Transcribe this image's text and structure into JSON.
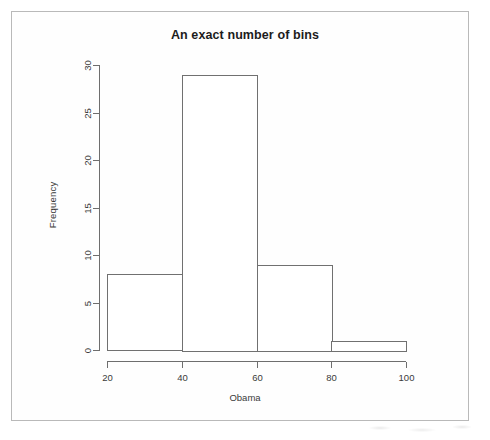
{
  "chart_data": {
    "type": "bar",
    "title": "An exact number of bins",
    "xlabel": "Obama",
    "ylabel": "Frequency",
    "categories": [
      "20-40",
      "40-60",
      "60-80",
      "80-100"
    ],
    "bin_edges": [
      20,
      40,
      60,
      80,
      100
    ],
    "values": [
      8,
      29,
      9,
      1
    ],
    "xlim": [
      20,
      100
    ],
    "ylim": [
      0,
      30
    ],
    "x_ticks": [
      20,
      40,
      60,
      80,
      100
    ],
    "y_ticks": [
      0,
      5,
      10,
      15,
      20,
      25,
      30
    ],
    "x_tick_labels": [
      "20",
      "40",
      "60",
      "80",
      "100"
    ],
    "y_tick_labels": [
      "0",
      "5",
      "10",
      "15",
      "20",
      "25",
      "30"
    ],
    "grid": false,
    "legend": false,
    "bar_fill_color": "#ffffff",
    "bar_border_color": "#707070",
    "axis_color": "#6e6e6e",
    "background_color": "#ffffff"
  },
  "figure": {
    "title": "An exact number of bins",
    "xlabel": "Obama",
    "ylabel": "Frequency"
  }
}
